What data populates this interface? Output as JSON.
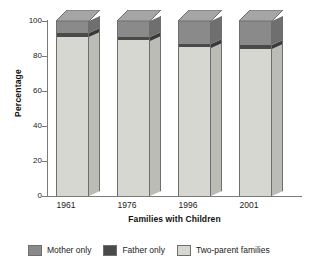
{
  "chart_data": {
    "type": "bar",
    "subtype": "stacked-3d-column",
    "title": "",
    "xlabel": "Families with Children",
    "ylabel": "Percentage",
    "categories": [
      "1961",
      "1976",
      "1996",
      "2001"
    ],
    "ylim": [
      0,
      100
    ],
    "yticks": [
      "0",
      "20",
      "40",
      "60",
      "80",
      "100"
    ],
    "grid": false,
    "legend_position": "bottom",
    "stack_order_bottom_to_top": [
      "Two-parent families",
      "Father only",
      "Mother only"
    ],
    "series": [
      {
        "name": "Two-parent families",
        "color": "#d7d7d2",
        "values": [
          91,
          89,
          85,
          84
        ]
      },
      {
        "name": "Father only",
        "color": "#4a4a4a",
        "values": [
          2,
          2,
          2,
          2.5
        ]
      },
      {
        "name": "Mother only",
        "color": "#8a8a8a",
        "values": [
          7,
          9,
          13,
          13.5
        ]
      }
    ]
  },
  "axes": {
    "y_label": "Percentage",
    "x_label": "Families with Children",
    "y_ticks": [
      {
        "value": 100,
        "label": "100"
      },
      {
        "value": 80,
        "label": "80"
      },
      {
        "value": 60,
        "label": "60"
      },
      {
        "value": 40,
        "label": "40"
      },
      {
        "value": 20,
        "label": "20"
      },
      {
        "value": 0,
        "label": "0"
      }
    ],
    "x_ticks": [
      {
        "label": "1961"
      },
      {
        "label": "1976"
      },
      {
        "label": "1996"
      },
      {
        "label": "2001"
      }
    ]
  },
  "legend": {
    "items": [
      {
        "label": "Mother only",
        "color": "#8a8a8a"
      },
      {
        "label": "Father only",
        "color": "#4a4a4a"
      },
      {
        "label": "Two-parent families",
        "color": "#d7d7d2"
      }
    ]
  },
  "colors": {
    "mother_only": "#8a8a8a",
    "father_only": "#4a4a4a",
    "two_parent": "#d7d7d2",
    "mother_only_top": "#a5a5a5",
    "mother_only_side": "#6f6f6f",
    "father_only_side": "#3a3a3a",
    "two_parent_side": "#bcbcb6",
    "axis": "#7a7a7a",
    "outline": "#6e6e6e",
    "background": "#ffffff"
  }
}
